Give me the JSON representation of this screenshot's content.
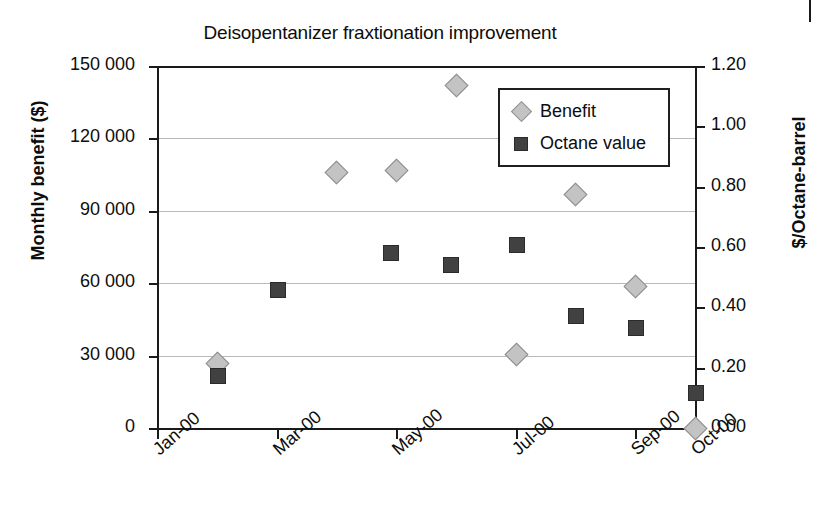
{
  "chart_data": {
    "type": "scatter",
    "title": "Deisopentanizer fraxtionation improvement",
    "xlabel": "",
    "ylabel": "Monthly benefit ($)",
    "y2label": "$/Octane-barrel",
    "grid": true,
    "legend_position": "inside-top-right",
    "x_tick_labels": [
      "Jan-00",
      "Mar-00",
      "May-00",
      "Jul-00",
      "Sep-00",
      "Oct-00"
    ],
    "x_tick_months": [
      0,
      2,
      4,
      6,
      8,
      9
    ],
    "y_tick_labels": [
      "0",
      "30 000",
      "60 000",
      "90 000",
      "120 000",
      "150 000"
    ],
    "y_tick_values": [
      0,
      30000,
      60000,
      90000,
      120000,
      150000
    ],
    "ylim": [
      0,
      150000
    ],
    "y2_tick_labels": [
      "0.00",
      "0.20",
      "0.40",
      "0.60",
      "0.80",
      "1.00",
      "1.20"
    ],
    "y2_tick_values": [
      0.0,
      0.2,
      0.4,
      0.6,
      0.8,
      1.0,
      1.2
    ],
    "y2lim": [
      0.0,
      1.2
    ],
    "series": [
      {
        "name": "Benefit",
        "marker": "diamond",
        "color": "#c3c3c3",
        "axis": "left",
        "x_months": [
          1.0,
          3.0,
          4.0,
          5.0,
          6.0,
          7.0,
          8.0,
          9.0
        ],
        "values": [
          27000,
          106000,
          107000,
          142000,
          30500,
          97000,
          59000,
          0
        ]
      },
      {
        "name": "Octane value",
        "marker": "square",
        "color": "#414141",
        "axis": "right",
        "x_months": [
          1.0,
          2.0,
          3.9,
          4.9,
          6.0,
          7.0,
          8.0,
          9.0
        ],
        "values": [
          0.175,
          0.46,
          0.585,
          0.545,
          0.61,
          0.375,
          0.335,
          0.12
        ]
      }
    ]
  },
  "legend": {
    "entries": [
      {
        "label": "Benefit",
        "icon": "diamond-marker-icon"
      },
      {
        "label": "Octane value",
        "icon": "square-marker-icon"
      }
    ]
  },
  "colors": {
    "benefit": "#c3c3c3",
    "octane": "#414141",
    "axis": "#1a1a1a",
    "grid": "#b9b9b9",
    "background": "#ffffff"
  }
}
